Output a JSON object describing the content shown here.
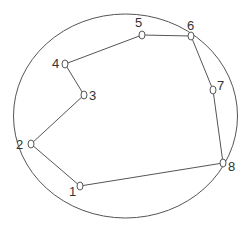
{
  "diagram": {
    "type": "polygon-in-ellipse",
    "colors": {
      "stroke": "#555555",
      "label": "#333333",
      "background": "#ffffff"
    },
    "ellipse": {
      "cx": 125.5,
      "cy": 116,
      "rx": 112,
      "ry": 102
    },
    "nodes": [
      {
        "id": "1",
        "label": "1",
        "x": 80,
        "y": 186,
        "lx": 69,
        "ly": 196
      },
      {
        "id": "2",
        "label": "2",
        "x": 31,
        "y": 144,
        "lx": 16,
        "ly": 149
      },
      {
        "id": "3",
        "label": "3",
        "x": 84,
        "y": 95,
        "lx": 89,
        "ly": 100
      },
      {
        "id": "4",
        "label": "4",
        "x": 65,
        "y": 64,
        "lx": 52,
        "ly": 68
      },
      {
        "id": "5",
        "label": "5",
        "x": 142,
        "y": 35,
        "lx": 135,
        "ly": 27
      },
      {
        "id": "6",
        "label": "6",
        "x": 191,
        "y": 36,
        "lx": 187,
        "ly": 30
      },
      {
        "id": "7",
        "label": "7",
        "x": 213,
        "y": 90,
        "lx": 217,
        "ly": 90
      },
      {
        "id": "8",
        "label": "8",
        "x": 223,
        "y": 163,
        "lx": 228,
        "ly": 171
      }
    ],
    "edges": [
      [
        "1",
        "2"
      ],
      [
        "2",
        "3"
      ],
      [
        "3",
        "4"
      ],
      [
        "4",
        "5"
      ],
      [
        "5",
        "6"
      ],
      [
        "6",
        "7"
      ],
      [
        "7",
        "8"
      ],
      [
        "8",
        "1"
      ]
    ]
  }
}
